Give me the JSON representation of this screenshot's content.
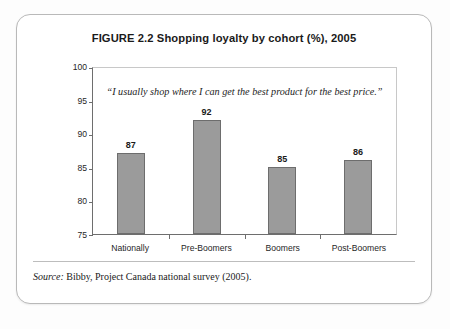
{
  "figure": {
    "title": "FIGURE 2.2  Shopping loyalty by cohort (%), 2005",
    "source_label": "Source:",
    "source_text": " Bibby, Project Canada national survey (2005)."
  },
  "chart_data": {
    "type": "bar",
    "title": "FIGURE 2.2  Shopping loyalty by cohort (%), 2005",
    "annotation": "“I usually shop where I can get the best product for the best price.”",
    "categories": [
      "Nationally",
      "Pre-Boomers",
      "Boomers",
      "Post-Boomers"
    ],
    "values": [
      87,
      92,
      85,
      86
    ],
    "data_labels": [
      "87",
      "92",
      "85",
      "86"
    ],
    "xlabel": "",
    "ylabel": "",
    "ylim": [
      75,
      100
    ],
    "yticks": [
      100,
      95,
      90,
      85,
      80,
      75
    ],
    "ytick_labels": [
      "100",
      "95",
      "90",
      "85",
      "80",
      "75"
    ],
    "grid": false,
    "legend": "none",
    "bar_color": "#9b9b9b",
    "bar_border_color": "#6d6d6d",
    "axis_color": "#6e6e6e",
    "frame_color": "#c8c8c8",
    "text_color": "#1a1a1a",
    "background": "#ffffff"
  }
}
